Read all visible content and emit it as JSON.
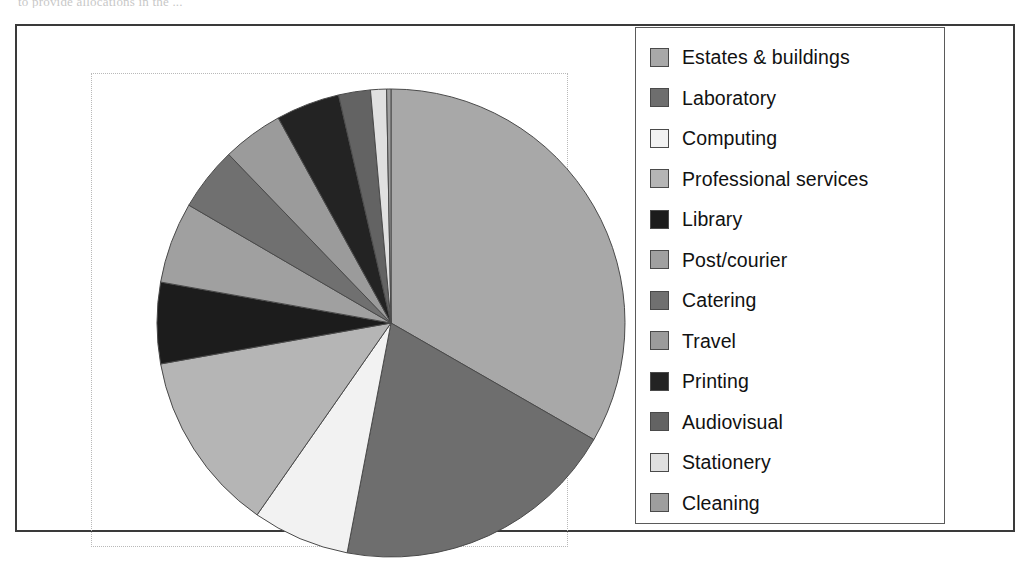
{
  "caption": {
    "text": "to provide allocations in the ..."
  },
  "figure": {
    "frame_color": "#3a3a3a",
    "plot_border_color": "#b9b9b9",
    "background": "#ffffff"
  },
  "legend": {
    "border_color": "#5a5a5a",
    "items": [
      {
        "label": "Estates & buildings",
        "color": "#a8a8a8"
      },
      {
        "label": "Laboratory",
        "color": "#6e6e6e"
      },
      {
        "label": "Computing",
        "color": "#f2f2f2"
      },
      {
        "label": "Professional  services",
        "color": "#b5b5b5"
      },
      {
        "label": "Library",
        "color": "#1c1c1c"
      },
      {
        "label": "Post/courier",
        "color": "#a0a0a0"
      },
      {
        "label": "Catering",
        "color": "#707070"
      },
      {
        "label": "Travel",
        "color": "#9b9b9b"
      },
      {
        "label": "Printing",
        "color": "#232323"
      },
      {
        "label": "Audiovisual",
        "color": "#636363"
      },
      {
        "label": "Stationery",
        "color": "#e0e0e0"
      },
      {
        "label": "Cleaning",
        "color": "#9e9e9e"
      }
    ]
  },
  "chart_data": {
    "type": "pie",
    "title": "",
    "start_angle_deg": 0,
    "direction": "clockwise",
    "legend_position": "right",
    "grid": false,
    "units": "percent",
    "categories": [
      "Estates & buildings",
      "Laboratory",
      "Computing",
      "Professional  services",
      "Library",
      "Post/courier",
      "Catering",
      "Travel",
      "Printing",
      "Audiovisual",
      "Stationery",
      "Cleaning"
    ],
    "values": [
      33.3,
      19.7,
      6.7,
      12.5,
      5.6,
      5.6,
      4.4,
      4.2,
      4.4,
      2.2,
      1.1,
      0.3
    ],
    "colors": [
      "#a8a8a8",
      "#6e6e6e",
      "#f2f2f2",
      "#b5b5b5",
      "#1c1c1c",
      "#a0a0a0",
      "#707070",
      "#9b9b9b",
      "#232323",
      "#636363",
      "#e0e0e0",
      "#9e9e9e"
    ],
    "slice_edge_color": "#4a4a4a"
  }
}
